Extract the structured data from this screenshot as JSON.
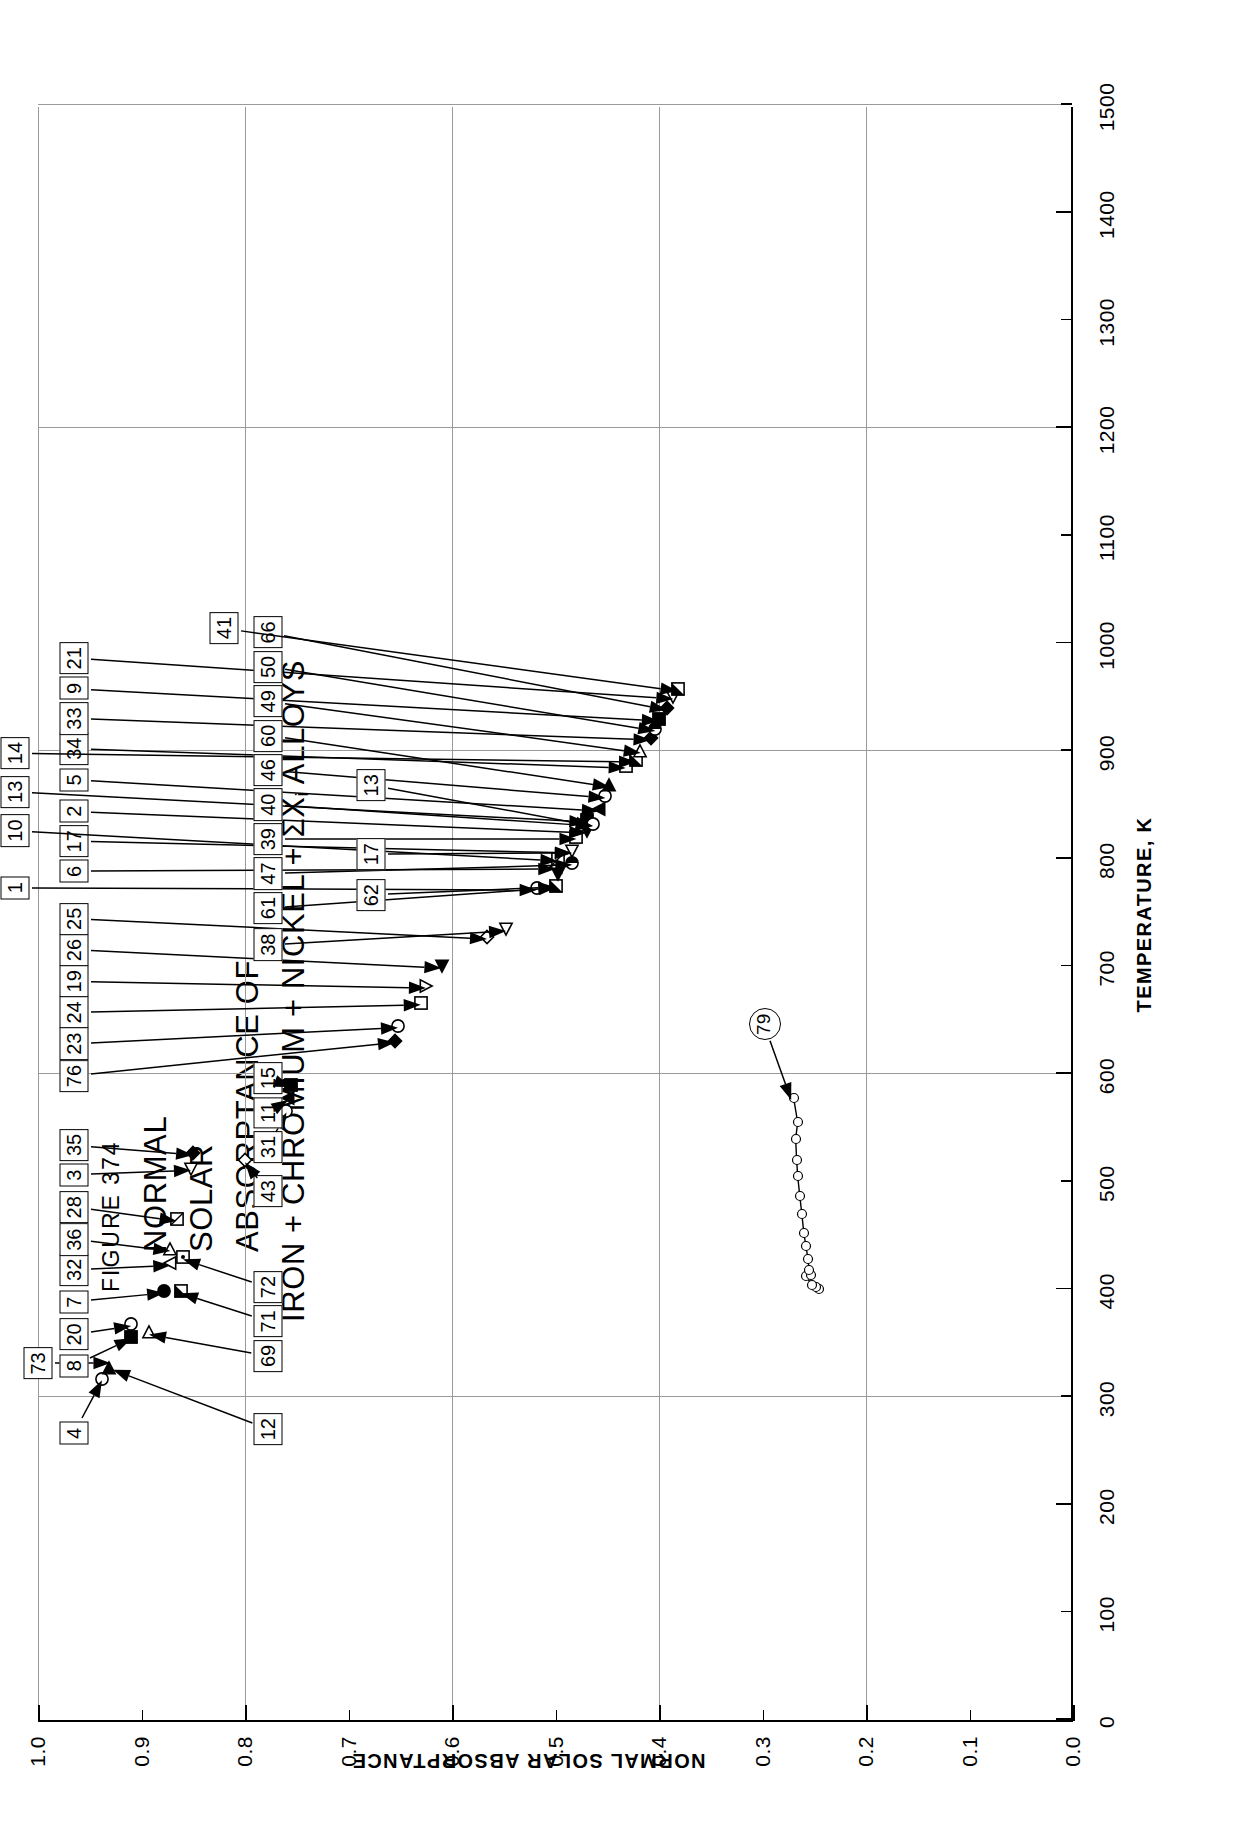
{
  "figure": {
    "number_label": "FIGURE  374",
    "title_lines": [
      "NORMAL",
      "SOLAR",
      "ABSORPTANCE OF"
    ],
    "title_line_formula_pre": "IRON + CHROMIUM + NICKEL + ΣX",
    "title_line_formula_sub": "i",
    "title_line_formula_post": "  ALLOYS"
  },
  "axes": {
    "x": {
      "title": "TEMPERATURE, K",
      "min": 0,
      "max": 1500,
      "major_step": 100,
      "ticks": [
        0,
        100,
        200,
        300,
        400,
        500,
        600,
        700,
        800,
        900,
        1000,
        1100,
        1200,
        1300,
        1400,
        1500
      ],
      "tick_labels": [
        "0",
        "100",
        "200",
        "300",
        "400",
        "500",
        "600",
        "700",
        "800",
        "900",
        "1000",
        "1100",
        "1200",
        "1300",
        "1400",
        "1500"
      ],
      "gridlines": [
        300,
        600,
        900,
        1200,
        1500
      ]
    },
    "y": {
      "title": "NORMAL SOLAR ABSORPTANCE",
      "min": 0.0,
      "max": 1.0,
      "major_step": 0.1,
      "ticks": [
        0.0,
        0.1,
        0.2,
        0.3,
        0.4,
        0.5,
        0.6,
        0.7,
        0.8,
        0.9,
        1.0
      ],
      "tick_labels": [
        "0.0",
        "0.1",
        "0.2",
        "0.3",
        "0.4",
        "0.5",
        "0.6",
        "0.7",
        "0.8",
        "0.9",
        "1.0"
      ],
      "gridlines": [
        0.2,
        0.4,
        0.6,
        0.8,
        1.0
      ]
    }
  },
  "chart_data": {
    "type": "scatter",
    "title": "NORMAL SOLAR ABSORPTANCE OF IRON + CHROMIUM + NICKEL + ΣXi ALLOYS",
    "xlabel": "TEMPERATURE, K",
    "ylabel": "NORMAL SOLAR ABSORPTANCE",
    "xlim": [
      0,
      1500
    ],
    "ylim": [
      0.0,
      1.0
    ],
    "grid": true,
    "legend": "none",
    "points": [
      {
        "curve": "4",
        "x": 317,
        "y": 0.938,
        "marker": "circle-open"
      },
      {
        "curve": "12",
        "x": 327,
        "y": 0.931,
        "marker": "triangle-right-filled"
      },
      {
        "curve": "8",
        "x": 356,
        "y": 0.91,
        "marker": "square-filled"
      },
      {
        "curve": "20",
        "x": 368,
        "y": 0.91,
        "marker": "circle-open"
      },
      {
        "curve": "69",
        "x": 360,
        "y": 0.893,
        "marker": "triangle-right-open"
      },
      {
        "curve": "7",
        "x": 398,
        "y": 0.878,
        "marker": "circle-filled"
      },
      {
        "curve": "71",
        "x": 398,
        "y": 0.862,
        "marker": "square-half"
      },
      {
        "curve": "32",
        "x": 424,
        "y": 0.872,
        "marker": "triangle-up-open"
      },
      {
        "curve": "36",
        "x": 437,
        "y": 0.872,
        "marker": "triangle-right-open"
      },
      {
        "curve": "72",
        "x": 430,
        "y": 0.86,
        "marker": "square-dotted"
      },
      {
        "curve": "28",
        "x": 465,
        "y": 0.866,
        "marker": "square-crossed"
      },
      {
        "curve": "3",
        "x": 512,
        "y": 0.852,
        "marker": "triangle-left-open"
      },
      {
        "curve": "35",
        "x": 527,
        "y": 0.85,
        "marker": "diamond-filled"
      },
      {
        "curve": "43",
        "x": 520,
        "y": 0.8,
        "marker": "diamond-open"
      },
      {
        "curve": "31",
        "x": 566,
        "y": 0.76,
        "marker": "circle-open"
      },
      {
        "curve": "11",
        "x": 578,
        "y": 0.758,
        "marker": "triangle-up-filled"
      },
      {
        "curve": "15",
        "x": 590,
        "y": 0.756,
        "marker": "square-filled"
      },
      {
        "curve": "76",
        "x": 631,
        "y": 0.655,
        "marker": "diamond-filled"
      },
      {
        "curve": "23",
        "x": 645,
        "y": 0.652,
        "marker": "circle-open"
      },
      {
        "curve": "24",
        "x": 666,
        "y": 0.63,
        "marker": "square-open"
      },
      {
        "curve": "19",
        "x": 682,
        "y": 0.625,
        "marker": "triangle-down-open"
      },
      {
        "curve": "26",
        "x": 700,
        "y": 0.61,
        "marker": "triangle-left-filled"
      },
      {
        "curve": "25",
        "x": 727,
        "y": 0.566,
        "marker": "diamond-open"
      },
      {
        "curve": "38",
        "x": 735,
        "y": 0.548,
        "marker": "triangle-left-open"
      },
      {
        "curve": "1",
        "x": 773,
        "y": 0.518,
        "marker": "circle-open"
      },
      {
        "curve": "61",
        "x": 775,
        "y": 0.5,
        "marker": "square-half"
      },
      {
        "curve": "6",
        "x": 792,
        "y": 0.5,
        "marker": "triangle-up-open"
      },
      {
        "curve": "62",
        "x": 786,
        "y": 0.498,
        "marker": "triangle-left-filled"
      },
      {
        "curve": "10",
        "x": 800,
        "y": 0.498,
        "marker": "square-crossed"
      },
      {
        "curve": "47",
        "x": 796,
        "y": 0.484,
        "marker": "circle-half"
      },
      {
        "curve": "17",
        "x": 807,
        "y": 0.484,
        "marker": "triangle-left-open"
      },
      {
        "curve": "39",
        "x": 820,
        "y": 0.48,
        "marker": "square-open"
      },
      {
        "curve": "2",
        "x": 826,
        "y": 0.47,
        "marker": "triangle-left-filled"
      },
      {
        "curve": "13",
        "x": 836,
        "y": 0.47,
        "marker": "square-filled"
      },
      {
        "curve": "40",
        "x": 832,
        "y": 0.464,
        "marker": "circle-open"
      },
      {
        "curve": "5",
        "x": 846,
        "y": 0.458,
        "marker": "triangle-up-filled"
      },
      {
        "curve": "46",
        "x": 858,
        "y": 0.452,
        "marker": "circle-open"
      },
      {
        "curve": "60",
        "x": 868,
        "y": 0.448,
        "marker": "triangle-right-filled"
      },
      {
        "curve": "34",
        "x": 886,
        "y": 0.432,
        "marker": "square-open"
      },
      {
        "curve": "14",
        "x": 892,
        "y": 0.422,
        "marker": "square-half"
      },
      {
        "curve": "49",
        "x": 900,
        "y": 0.418,
        "marker": "triangle-right-open"
      },
      {
        "curve": "33",
        "x": 912,
        "y": 0.408,
        "marker": "diamond-filled"
      },
      {
        "curve": "50",
        "x": 920,
        "y": 0.404,
        "marker": "circle-half"
      },
      {
        "curve": "9",
        "x": 930,
        "y": 0.4,
        "marker": "square-filled"
      },
      {
        "curve": "66",
        "x": 940,
        "y": 0.392,
        "marker": "diamond-filled"
      },
      {
        "curve": "21",
        "x": 950,
        "y": 0.386,
        "marker": "triangle-left-open"
      },
      {
        "curve": "41",
        "x": 958,
        "y": 0.382,
        "marker": "square-half"
      }
    ],
    "curves": [
      {
        "name": "79",
        "marker": "circle-open",
        "x": [
          400,
          402,
          404,
          412,
          413,
          418,
          428,
          440,
          452,
          470,
          487,
          505,
          520,
          540,
          555,
          578
        ],
        "y": [
          0.245,
          0.248,
          0.252,
          0.258,
          0.253,
          0.255,
          0.256,
          0.258,
          0.26,
          0.262,
          0.264,
          0.266,
          0.267,
          0.268,
          0.266,
          0.27
        ]
      }
    ]
  },
  "callouts_top": [
    {
      "id": "73",
      "x": 333,
      "y": 1.0,
      "target_x": 333,
      "target_y": 0.93
    },
    {
      "id": "4",
      "x": 268,
      "y": 0.965,
      "target_x": 317,
      "target_y": 0.938
    },
    {
      "id": "8",
      "x": 331,
      "y": 0.965,
      "target_x": 356,
      "target_y": 0.91
    },
    {
      "id": "20",
      "x": 360,
      "y": 0.965,
      "target_x": 368,
      "target_y": 0.91
    },
    {
      "id": "7",
      "x": 390,
      "y": 0.965,
      "target_x": 398,
      "target_y": 0.878
    },
    {
      "id": "32",
      "x": 420,
      "y": 0.965,
      "target_x": 424,
      "target_y": 0.872
    },
    {
      "id": "36",
      "x": 448,
      "y": 0.965,
      "target_x": 437,
      "target_y": 0.872
    },
    {
      "id": "28",
      "x": 478,
      "y": 0.965,
      "target_x": 465,
      "target_y": 0.866
    },
    {
      "id": "3",
      "x": 508,
      "y": 0.965,
      "target_x": 512,
      "target_y": 0.852
    },
    {
      "id": "35",
      "x": 536,
      "y": 0.965,
      "target_x": 527,
      "target_y": 0.85
    },
    {
      "id": "76",
      "x": 600,
      "y": 0.965,
      "target_x": 631,
      "target_y": 0.655
    },
    {
      "id": "23",
      "x": 630,
      "y": 0.965,
      "target_x": 645,
      "target_y": 0.652
    },
    {
      "id": "24",
      "x": 659,
      "y": 0.965,
      "target_x": 666,
      "target_y": 0.63
    },
    {
      "id": "19",
      "x": 688,
      "y": 0.965,
      "target_x": 682,
      "target_y": 0.625
    },
    {
      "id": "26",
      "x": 717,
      "y": 0.965,
      "target_x": 700,
      "target_y": 0.61
    },
    {
      "id": "25",
      "x": 746,
      "y": 0.965,
      "target_x": 727,
      "target_y": 0.566
    },
    {
      "id": "6",
      "x": 790,
      "y": 0.965,
      "target_x": 792,
      "target_y": 0.5
    },
    {
      "id": "17",
      "x": 818,
      "y": 0.965,
      "target_x": 807,
      "target_y": 0.484
    },
    {
      "id": "2",
      "x": 846,
      "y": 0.965,
      "target_x": 826,
      "target_y": 0.47
    },
    {
      "id": "5",
      "x": 875,
      "y": 0.965,
      "target_x": 846,
      "target_y": 0.458
    },
    {
      "id": "34",
      "x": 904,
      "y": 0.965,
      "target_x": 886,
      "target_y": 0.432
    },
    {
      "id": "33",
      "x": 932,
      "y": 0.965,
      "target_x": 912,
      "target_y": 0.408
    },
    {
      "id": "9",
      "x": 960,
      "y": 0.965,
      "target_x": 930,
      "target_y": 0.4
    },
    {
      "id": "21",
      "x": 988,
      "y": 0.965,
      "target_x": 950,
      "target_y": 0.386
    }
  ],
  "callouts_upper_offset": [
    {
      "id": "1",
      "x": 775,
      "y": 1.022,
      "target_x": 773,
      "target_y": 0.518
    },
    {
      "id": "10",
      "x": 828,
      "y": 1.022,
      "target_x": 800,
      "target_y": 0.498
    },
    {
      "id": "13",
      "x": 864,
      "y": 1.022,
      "target_x": 836,
      "target_y": 0.47
    },
    {
      "id": "14",
      "x": 900,
      "y": 1.022,
      "target_x": 892,
      "target_y": 0.422
    }
  ],
  "callouts_bottom": [
    {
      "id": "12",
      "x": 272,
      "y": 0.778,
      "target_x": 327,
      "target_y": 0.928
    },
    {
      "id": "69",
      "x": 340,
      "y": 0.778,
      "target_x": 360,
      "target_y": 0.893
    },
    {
      "id": "71",
      "x": 372,
      "y": 0.778,
      "target_x": 398,
      "target_y": 0.862
    },
    {
      "id": "72",
      "x": 404,
      "y": 0.778,
      "target_x": 430,
      "target_y": 0.86
    },
    {
      "id": "43",
      "x": 493,
      "y": 0.778,
      "target_x": 520,
      "target_y": 0.8
    },
    {
      "id": "31",
      "x": 534,
      "y": 0.778,
      "target_x": 566,
      "target_y": 0.76
    },
    {
      "id": "11",
      "x": 566,
      "y": 0.778,
      "target_x": 578,
      "target_y": 0.758
    },
    {
      "id": "15",
      "x": 598,
      "y": 0.778,
      "target_x": 590,
      "target_y": 0.756
    },
    {
      "id": "38",
      "x": 722,
      "y": 0.778,
      "target_x": 735,
      "target_y": 0.548
    },
    {
      "id": "61",
      "x": 756,
      "y": 0.778,
      "target_x": 775,
      "target_y": 0.5
    },
    {
      "id": "47",
      "x": 788,
      "y": 0.778,
      "target_x": 796,
      "target_y": 0.484
    },
    {
      "id": "39",
      "x": 820,
      "y": 0.778,
      "target_x": 820,
      "target_y": 0.48
    },
    {
      "id": "40",
      "x": 852,
      "y": 0.778,
      "target_x": 832,
      "target_y": 0.464
    },
    {
      "id": "46",
      "x": 884,
      "y": 0.778,
      "target_x": 858,
      "target_y": 0.452
    },
    {
      "id": "60",
      "x": 916,
      "y": 0.778,
      "target_x": 868,
      "target_y": 0.448
    },
    {
      "id": "49",
      "x": 948,
      "y": 0.778,
      "target_x": 900,
      "target_y": 0.418
    },
    {
      "id": "50",
      "x": 980,
      "y": 0.778,
      "target_x": 920,
      "target_y": 0.404
    },
    {
      "id": "66",
      "x": 1012,
      "y": 0.778,
      "target_x": 940,
      "target_y": 0.392
    }
  ],
  "callouts_lower_offset": [
    {
      "id": "62",
      "x": 768,
      "y": 0.678,
      "target_x": 775,
      "target_y": 0.5
    },
    {
      "id": "17",
      "x": 806,
      "y": 0.678,
      "target_x": 807,
      "target_y": 0.484
    },
    {
      "id": "13",
      "x": 870,
      "y": 0.678,
      "target_x": 832,
      "target_y": 0.464
    },
    {
      "id": "41",
      "x": 1016,
      "y": 0.82,
      "target_x": 958,
      "target_y": 0.382
    }
  ],
  "callouts_circle": [
    {
      "id": "79",
      "x": 648,
      "y": 0.298,
      "target_x": 578,
      "target_y": 0.272
    }
  ]
}
